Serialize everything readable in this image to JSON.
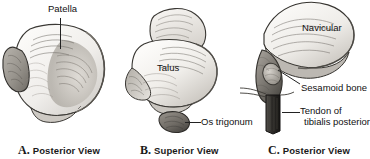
{
  "figure": {
    "background_color": "#ffffff",
    "ink_color": "#222222",
    "panels": [
      {
        "id": "A",
        "caption_letter": "A.",
        "caption_text": "Posterior View",
        "subject": "patella",
        "labels": [
          {
            "name": "patella",
            "text": "Patella",
            "leader": "vertical"
          }
        ]
      },
      {
        "id": "B",
        "caption_letter": "B.",
        "caption_text": "Superior View",
        "subject": "talus",
        "labels": [
          {
            "name": "talus",
            "text": "Talus",
            "leader": "none"
          },
          {
            "name": "os-trigonum",
            "text": "Os trigonum",
            "leader": "horizontal"
          }
        ]
      },
      {
        "id": "C",
        "caption_letter": "C.",
        "caption_text": "Posterior View",
        "subject": "navicular",
        "labels": [
          {
            "name": "navicular",
            "text": "Navicular",
            "leader": "none"
          },
          {
            "name": "sesamoid-bone",
            "text": "Sesamoid bone",
            "leader": "diagonal"
          },
          {
            "name": "tendon-of-tibialis-posterior",
            "text_line1": "Tendon of",
            "text_line2": "tibialis posterior",
            "leader": "horizontal"
          }
        ]
      }
    ]
  },
  "panel_a": {
    "caption_letter": "A.",
    "caption_text": "Posterior View",
    "patella_label": "Patella"
  },
  "panel_b": {
    "caption_letter": "B.",
    "caption_text": "Superior View",
    "talus_label": "Talus",
    "os_trigonum_label": "Os trigonum"
  },
  "panel_c": {
    "caption_letter": "C.",
    "caption_text": "Posterior View",
    "navicular_label": "Navicular",
    "sesamoid_label": "Sesamoid bone",
    "tendon_label_line1": "Tendon of",
    "tendon_label_line2": "tibialis posterior"
  }
}
